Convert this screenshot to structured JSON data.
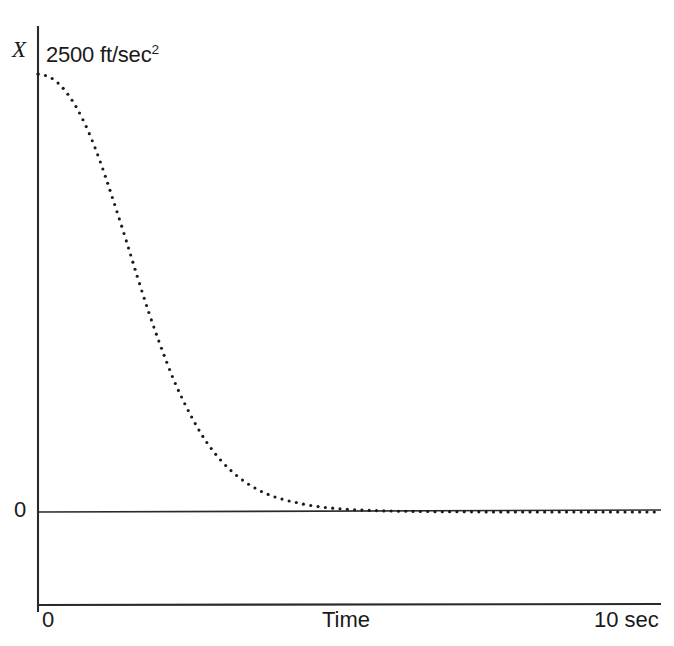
{
  "chart_data": {
    "type": "line",
    "title": "",
    "subtitle": "",
    "xlabel": "Time",
    "ylabel": "X",
    "y_peak_label": "2500 ft/sec",
    "y_peak_exponent": "2",
    "y_zero_label": "0",
    "x_origin_label": "0",
    "x_max_label": "10 sec",
    "xlim": [
      0,
      10
    ],
    "ylim": [
      0,
      2500
    ],
    "grid": false,
    "legend": null,
    "series_style": "dotted",
    "series": [
      {
        "name": "X",
        "x": [
          0.0,
          0.2,
          0.4,
          0.6,
          0.8,
          1.0,
          1.2,
          1.4,
          1.6,
          1.8,
          2.0,
          2.2,
          2.4,
          2.6,
          2.8,
          3.0,
          3.2,
          3.4,
          3.6,
          3.8,
          4.0,
          4.4,
          4.8,
          5.2,
          5.6,
          6.0,
          6.5,
          7.0,
          7.5,
          8.0,
          8.5,
          9.0,
          9.5,
          10.0
        ],
        "values": [
          2500,
          2480,
          2420,
          2320,
          2180,
          2000,
          1790,
          1570,
          1340,
          1120,
          920,
          740,
          590,
          460,
          355,
          272,
          206,
          155,
          116,
          87,
          65,
          36,
          20,
          11,
          6,
          3.5,
          1.8,
          0.9,
          0.5,
          0.25,
          0.12,
          0.06,
          0.03,
          0
        ]
      }
    ],
    "annotations": [
      {
        "text": "2500 ft/sec2",
        "position": "top-left-of-curve"
      }
    ],
    "axes": {
      "y_axis_x_px": 38,
      "x_axis_y_px": 605,
      "zero_line_y_px": 512,
      "plot_top_y_px": 74,
      "plot_right_x_px": 660
    },
    "colors": {
      "curve": "#1a1a1a",
      "axis": "#1a1a1a",
      "background": "#ffffff"
    }
  }
}
